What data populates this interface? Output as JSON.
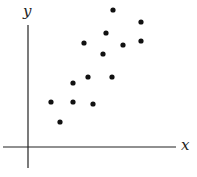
{
  "chart_data": {
    "type": "scatter",
    "title": "",
    "xlabel": "x",
    "ylabel": "y",
    "grid": false,
    "legend": null,
    "ticks": false,
    "xlim": [
      -2.5,
      14.8
    ],
    "ylim": [
      -2.1,
      12.3
    ],
    "points": [
      {
        "x": 2.3,
        "y": 4.5
      },
      {
        "x": 3.2,
        "y": 2.5
      },
      {
        "x": 4.5,
        "y": 6.4
      },
      {
        "x": 4.5,
        "y": 4.5
      },
      {
        "x": 6.0,
        "y": 7.0
      },
      {
        "x": 6.5,
        "y": 4.3
      },
      {
        "x": 5.6,
        "y": 10.4
      },
      {
        "x": 7.5,
        "y": 9.3
      },
      {
        "x": 7.8,
        "y": 11.4
      },
      {
        "x": 8.4,
        "y": 7.0
      },
      {
        "x": 8.5,
        "y": 13.7
      },
      {
        "x": 9.5,
        "y": 10.2
      },
      {
        "x": 11.3,
        "y": 12.5
      },
      {
        "x": 11.3,
        "y": 10.6
      }
    ],
    "marker_color": "#111111",
    "axis_color": "#222222"
  }
}
